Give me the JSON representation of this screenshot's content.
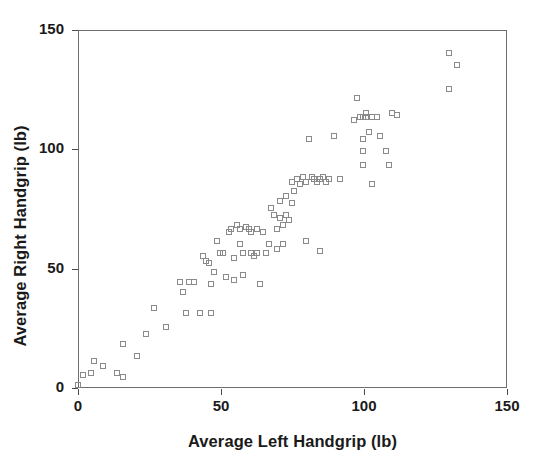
{
  "chart_data": {
    "type": "scatter",
    "title": "",
    "xlabel": "Average Left Handgrip (lb)",
    "ylabel": "Average Right Handgrip (lb)",
    "xlim": [
      0,
      150
    ],
    "ylim": [
      0,
      150
    ],
    "xticks": [
      0,
      50,
      100,
      150
    ],
    "yticks": [
      0,
      50,
      100,
      150
    ],
    "xticklabels": [
      "0",
      "50",
      "100",
      "150"
    ],
    "yticklabels": [
      "0",
      "50",
      "100",
      "150"
    ],
    "grid": false,
    "legend": null,
    "marker": "open-square",
    "marker_color": "#8a8a8a",
    "axis_color": "#6e6e6e",
    "background": "#ffffff",
    "series": [
      {
        "name": "Handgrip pairs",
        "points": [
          [
            0.5,
            1
          ],
          [
            2,
            5
          ],
          [
            5,
            6
          ],
          [
            6,
            11
          ],
          [
            9,
            9
          ],
          [
            14,
            6
          ],
          [
            16,
            18
          ],
          [
            16,
            4
          ],
          [
            21,
            13
          ],
          [
            24,
            22
          ],
          [
            27,
            33
          ],
          [
            31,
            25
          ],
          [
            36,
            44
          ],
          [
            37,
            40
          ],
          [
            38,
            31
          ],
          [
            39,
            44
          ],
          [
            41,
            44
          ],
          [
            43,
            31
          ],
          [
            44,
            55
          ],
          [
            45,
            53
          ],
          [
            46,
            52
          ],
          [
            47,
            43
          ],
          [
            47,
            31
          ],
          [
            48,
            48
          ],
          [
            49,
            61
          ],
          [
            50,
            56
          ],
          [
            51,
            56
          ],
          [
            52,
            46
          ],
          [
            53,
            65
          ],
          [
            54,
            66
          ],
          [
            55,
            54
          ],
          [
            55,
            45
          ],
          [
            56,
            68
          ],
          [
            57,
            66
          ],
          [
            57,
            60
          ],
          [
            58,
            56
          ],
          [
            58,
            47
          ],
          [
            59,
            67
          ],
          [
            60,
            66
          ],
          [
            61,
            65
          ],
          [
            61,
            56
          ],
          [
            62,
            55
          ],
          [
            63,
            66
          ],
          [
            63,
            56
          ],
          [
            64,
            43
          ],
          [
            65,
            65
          ],
          [
            66,
            56
          ],
          [
            67,
            60
          ],
          [
            68,
            75
          ],
          [
            69,
            72
          ],
          [
            70,
            66
          ],
          [
            70,
            58
          ],
          [
            71,
            78
          ],
          [
            71,
            71
          ],
          [
            72,
            68
          ],
          [
            72,
            60
          ],
          [
            73,
            80
          ],
          [
            73,
            72
          ],
          [
            74,
            70
          ],
          [
            75,
            86
          ],
          [
            75,
            77
          ],
          [
            76,
            82
          ],
          [
            77,
            87
          ],
          [
            78,
            85
          ],
          [
            79,
            88
          ],
          [
            80,
            86
          ],
          [
            80,
            61
          ],
          [
            81,
            104
          ],
          [
            82,
            88
          ],
          [
            83,
            87
          ],
          [
            84,
            86
          ],
          [
            85,
            87
          ],
          [
            85,
            57
          ],
          [
            86,
            88
          ],
          [
            87,
            86
          ],
          [
            88,
            87
          ],
          [
            90,
            105
          ],
          [
            92,
            87
          ],
          [
            97,
            112
          ],
          [
            98,
            121
          ],
          [
            99,
            113
          ],
          [
            100,
            113
          ],
          [
            100,
            104
          ],
          [
            100,
            99
          ],
          [
            100,
            93
          ],
          [
            101,
            115
          ],
          [
            101,
            113
          ],
          [
            102,
            107
          ],
          [
            103,
            113
          ],
          [
            103,
            85
          ],
          [
            105,
            113
          ],
          [
            106,
            105
          ],
          [
            108,
            99
          ],
          [
            109,
            93
          ],
          [
            110,
            115
          ],
          [
            112,
            114
          ],
          [
            130,
            140
          ],
          [
            130,
            125
          ],
          [
            133,
            135
          ]
        ]
      }
    ]
  }
}
